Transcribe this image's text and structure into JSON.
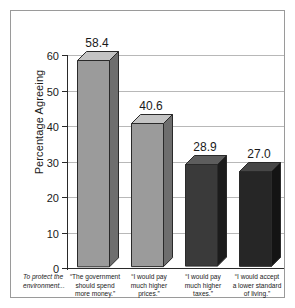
{
  "chart_data": {
    "type": "bar",
    "title": "",
    "subtitle": "",
    "xlabel": "",
    "ylabel": "Percentage Agreeing",
    "ylim": [
      0,
      60
    ],
    "yticks": [
      0,
      10,
      20,
      30,
      40,
      50,
      60
    ],
    "ytick_labels": [
      "0",
      "10",
      "20",
      "30",
      "40",
      "50",
      "60"
    ],
    "grid": true,
    "legend": false,
    "intro_label": "To protect the environment...",
    "categories": [
      "“The government should spend more money.”",
      "“I would pay much higher prices.”",
      "“I would pay much higher taxes.”",
      "“I would accept a lower standard of living.”"
    ],
    "values": [
      58.4,
      40.6,
      28.9,
      27.0
    ],
    "value_labels": [
      "58.4",
      "40.6",
      "28.9",
      "27.0"
    ],
    "bar_colors": [
      "#9b9b9b",
      "#9b9b9b",
      "#3a3a3a",
      "#262626"
    ],
    "bar_top_colors": [
      "#c4c4c4",
      "#c4c4c4",
      "#5d5d5d",
      "#474747"
    ],
    "bar_side_colors": [
      "#6e6e6e",
      "#6e6e6e",
      "#1c1c1c",
      "#141414"
    ],
    "axis_color": "#2a2a2a",
    "grid_color": "#b8b8b8",
    "background_color": "#ffffff",
    "frame_color": "#9a9a9a"
  },
  "category_lines": [
    [
      "“The government",
      "should spend",
      "more money.”"
    ],
    [
      "“I would pay",
      "much higher",
      "prices.”"
    ],
    [
      "“I would pay",
      "much higher",
      "taxes.”"
    ],
    [
      "“I would accept",
      "a lower standard",
      "of living.”"
    ]
  ],
  "intro_lines": [
    "To protect the",
    "environment..."
  ]
}
